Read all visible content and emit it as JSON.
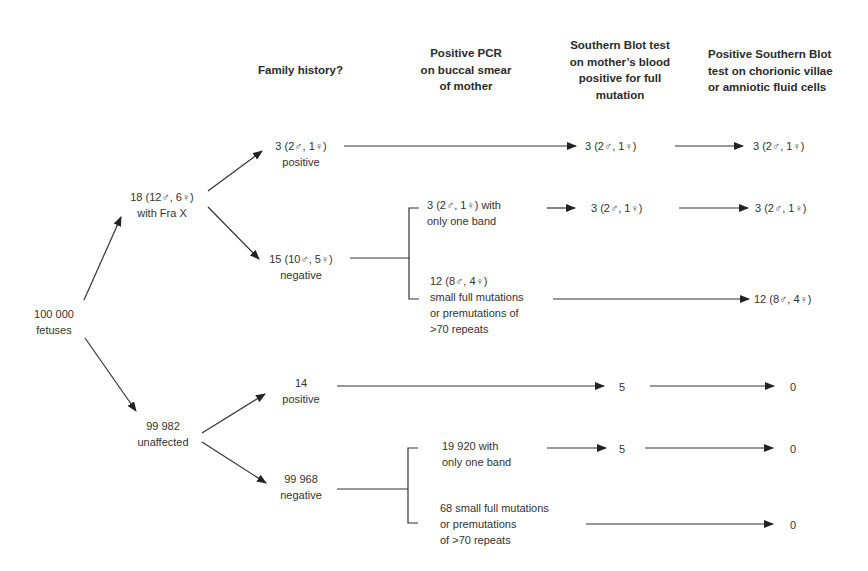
{
  "headers": {
    "family_history": "Family history?",
    "pcr": [
      "Positive PCR",
      "on buccal smear",
      "of mother"
    ],
    "southern_mother": [
      "Southern Blot test",
      "on mother’s blood",
      "positive for full",
      "mutation"
    ],
    "southern_fetal": [
      "Positive Southern Blot",
      "test on chorionic villae",
      "or amniotic fluid cells"
    ]
  },
  "root": {
    "count": "100 000",
    "label": "fetuses"
  },
  "affected": {
    "summary": "18 (12♂, 6♀)",
    "label": "with Fra X",
    "family_positive": {
      "count": "3 (2♂, 1♀)",
      "label": "positive",
      "southern_mother": "3 (2♂, 1♀)",
      "southern_fetal": "3 (2♂, 1♀)"
    },
    "family_negative": {
      "count": "15 (10♂, 5♀)",
      "label": "negative",
      "one_band": {
        "lines": [
          "3 (2♂, 1♀) with",
          "only one band"
        ],
        "southern_mother": "3 (2♂, 1♀)",
        "southern_fetal": "3 (2♂, 1♀)"
      },
      "small_full": {
        "lines": [
          "12 (8♂, 4♀)",
          "small full mutations",
          "or premutations of",
          ">70 repeats"
        ],
        "southern_fetal": "12 (8♂, 4♀)"
      }
    }
  },
  "unaffected": {
    "count": "99 982",
    "label": "unaffected",
    "family_positive": {
      "count": "14",
      "label": "positive",
      "southern_mother": "5",
      "southern_fetal": "0"
    },
    "family_negative": {
      "count": "99 968",
      "label": "negative",
      "one_band": {
        "lines": [
          "19 920 with",
          "only one band"
        ],
        "southern_mother": "5",
        "southern_fetal": "0"
      },
      "small_full": {
        "lines": [
          "68 small full mutations",
          "or premutations",
          "of >70 repeats"
        ],
        "southern_fetal": "0"
      }
    }
  }
}
